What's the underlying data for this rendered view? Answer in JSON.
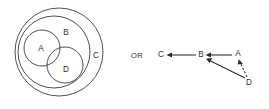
{
  "figure": {
    "type": "set-containment-and-dependency-graph",
    "connector_label": "OR"
  },
  "venn": {
    "title": "nested set diagram",
    "sets": [
      {
        "id": "C",
        "label": "C",
        "cx": 59,
        "cy": 52,
        "r": 44,
        "label_x": 96,
        "label_y": 56
      },
      {
        "id": "B",
        "label": "B",
        "cx": 54,
        "cy": 52,
        "r": 36,
        "label_x": 66,
        "label_y": 33
      },
      {
        "id": "A",
        "label": "A",
        "cx": 42,
        "cy": 48,
        "r": 18,
        "label_x": 41,
        "label_y": 49
      },
      {
        "id": "D",
        "label": "D",
        "cx": 65,
        "cy": 65,
        "r": 18,
        "label_x": 66,
        "label_y": 70
      }
    ],
    "relations": [
      "A is inside B",
      "D is inside B",
      "A and D overlap",
      "B is inside C"
    ]
  },
  "graph": {
    "title": "dependency graph",
    "nodes": [
      {
        "id": "C",
        "label": "C",
        "x": 161,
        "y": 55
      },
      {
        "id": "B",
        "label": "B",
        "x": 201,
        "y": 55
      },
      {
        "id": "A",
        "label": "A",
        "x": 238,
        "y": 54
      },
      {
        "id": "D",
        "label": "D",
        "x": 249,
        "y": 83
      }
    ],
    "edges": [
      {
        "from": "B",
        "to": "C",
        "style": "solid",
        "x1": 196,
        "y1": 55,
        "x2": 168,
        "y2": 55
      },
      {
        "from": "A",
        "to": "B",
        "style": "solid",
        "x1": 232,
        "y1": 55,
        "x2": 207,
        "y2": 55
      },
      {
        "from": "D",
        "to": "B",
        "style": "solid",
        "x1": 245,
        "y1": 78,
        "x2": 206,
        "y2": 59
      },
      {
        "from": "D",
        "to": "A",
        "style": "dashed",
        "x1": 247,
        "y1": 77,
        "x2": 239,
        "y2": 61
      }
    ]
  },
  "colors": {
    "background": "#ffffff",
    "stroke": "#3b3b3b",
    "edge": "#2b2b2b",
    "text": "#2e2e2e"
  }
}
